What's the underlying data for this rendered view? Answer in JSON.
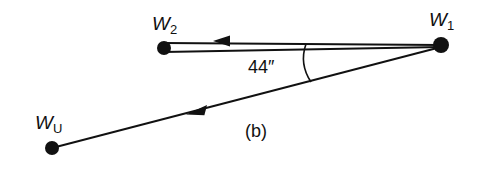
{
  "figure": {
    "caption": "(b)",
    "background_color": "#ffffff",
    "stroke_color": "#111111",
    "canvas": {
      "width": 480,
      "height": 169
    }
  },
  "vertices": [
    {
      "id": "w2",
      "name": "W2",
      "base_label": "W",
      "subscript": "2",
      "x": 164,
      "y": 48,
      "radius": 7,
      "label_x": 152,
      "label_y": 14
    },
    {
      "id": "w1",
      "name": "W1",
      "base_label": "W",
      "subscript": "1",
      "x": 441,
      "y": 45,
      "radius": 8,
      "label_x": 429,
      "label_y": 10
    },
    {
      "id": "wu",
      "name": "WU",
      "base_label": "W",
      "subscript": "U",
      "x": 52,
      "y": 148,
      "radius": 7,
      "label_x": 35,
      "label_y": 113
    }
  ],
  "edges": [
    {
      "id": "w1-to-w2",
      "name": "beam-w1-to-w2",
      "style": "double-line",
      "from": "w1",
      "to": "w2",
      "arrow_direction": "left",
      "arrow_x": 225,
      "arrow_y": 41
    },
    {
      "id": "w1-to-wu",
      "name": "beam-w1-to-wu",
      "style": "single-line",
      "from": "w1",
      "to": "wu",
      "arrow_direction": "down-left",
      "arrow_x": 198,
      "arrow_y": 110
    }
  ],
  "angle": {
    "value": "44",
    "unit_symbol": "″",
    "label": "44″",
    "vertex": "w1",
    "arc_top_x": 306,
    "arc_top_y": 44,
    "arc_bottom_x": 311,
    "arc_bottom_y": 82
  }
}
